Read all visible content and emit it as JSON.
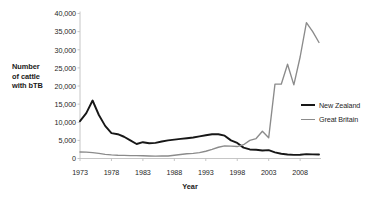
{
  "chart_data": {
    "type": "line",
    "title": "",
    "xlabel": "Year",
    "ylabel": "Number of cattle with bTB",
    "ylim": [
      0,
      40000
    ],
    "xlim": [
      1973,
      2011
    ],
    "grid": false,
    "legend_position": "right",
    "y_ticks": [
      "0",
      "5,000",
      "10,000",
      "15,000",
      "20,000",
      "25,000",
      "30,000",
      "35,000",
      "40,000"
    ],
    "y_tick_values": [
      0,
      5000,
      10000,
      15000,
      20000,
      25000,
      30000,
      35000,
      40000
    ],
    "x_ticks": [
      "1973",
      "1978",
      "1983",
      "1988",
      "1993",
      "1998",
      "2003",
      "2008"
    ],
    "x_tick_values": [
      1973,
      1978,
      1983,
      1988,
      1993,
      1998,
      2003,
      2008
    ],
    "x": [
      1973,
      1974,
      1975,
      1976,
      1977,
      1978,
      1979,
      1980,
      1981,
      1982,
      1983,
      1984,
      1985,
      1986,
      1987,
      1988,
      1989,
      1990,
      1991,
      1992,
      1993,
      1994,
      1995,
      1996,
      1997,
      1998,
      1999,
      2000,
      2001,
      2002,
      2003,
      2004,
      2005,
      2006,
      2007,
      2008,
      2009,
      2010,
      2011
    ],
    "series": [
      {
        "name": "New Zealand",
        "color": "#171717",
        "values": [
          10300,
          12500,
          16000,
          12000,
          9000,
          7000,
          6700,
          6000,
          5000,
          4000,
          4500,
          4200,
          4300,
          4700,
          5000,
          5200,
          5400,
          5600,
          5800,
          6100,
          6400,
          6700,
          6700,
          6300,
          5000,
          4300,
          3000,
          2500,
          2400,
          2200,
          2300,
          1700,
          1300,
          1100,
          1000,
          1050,
          1200,
          1150,
          1100
        ]
      },
      {
        "name": "Great Britain",
        "color": "#8b8b8b",
        "values": [
          1800,
          1750,
          1600,
          1400,
          1150,
          1000,
          900,
          850,
          800,
          800,
          750,
          700,
          650,
          700,
          700,
          900,
          1100,
          1300,
          1400,
          1600,
          2000,
          2500,
          3100,
          3500,
          3400,
          3300,
          3800,
          5000,
          5500,
          7500,
          5700,
          20500,
          20500,
          26000,
          20300,
          28000,
          37500,
          35000,
          32000
        ]
      }
    ]
  },
  "legend": {
    "items": [
      {
        "label": "New Zealand"
      },
      {
        "label": "Great Britain"
      }
    ]
  },
  "axes": {
    "y_title_lines": [
      "Number",
      "of cattle",
      "with bTB"
    ],
    "x_title": "Year"
  }
}
